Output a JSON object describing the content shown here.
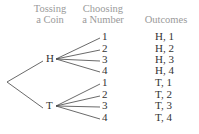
{
  "headers": {
    "coin": [
      "Tossing",
      "a Coin"
    ],
    "number": [
      "Choosing",
      "a Number"
    ],
    "outcomes": "Outcomes"
  },
  "tree": {
    "branches": [
      {
        "label": "H",
        "leaves": [
          "1",
          "2",
          "3",
          "4"
        ],
        "outcomes": [
          "H, 1",
          "H, 2",
          "H, 3",
          "H, 4"
        ]
      },
      {
        "label": "T",
        "leaves": [
          "1",
          "2",
          "3",
          "4"
        ],
        "outcomes": [
          "T, 1",
          "T, 2",
          "T, 3",
          "T, 4"
        ]
      }
    ]
  },
  "colors": {
    "header": "#9a9a9a",
    "text": "#333333",
    "line": "#444444"
  }
}
